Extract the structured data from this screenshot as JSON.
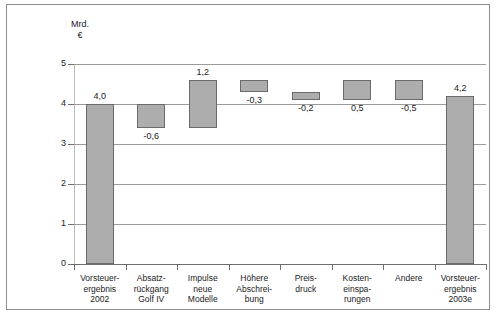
{
  "chart_data": {
    "type": "bar",
    "chart_style": "waterfall",
    "title": "",
    "subtitle": "",
    "unit_caption": "Mrd.\n€",
    "xlabel": "",
    "ylabel": "",
    "ylim": [
      0,
      5
    ],
    "yticks": [
      "0",
      "1",
      "2",
      "3",
      "4",
      "5"
    ],
    "grid": true,
    "legend": "none",
    "categories": [
      "Vorsteuer-\nergebnis\n2002",
      "Absatz-\nrückgang\nGolf IV",
      "Impulse\nneue\nModelle",
      "Höhere\nAbschrei-\nbung",
      "Preis-\ndruck",
      "Kosten-\neinspa-\nrungen",
      "Andere",
      "Vorsteuer-\nergebnis\n2003e"
    ],
    "data_labels": [
      "4,0",
      "-0,6",
      "1,2",
      "-0,3",
      "-0,2",
      "0,5",
      "-0,5",
      "4,2"
    ],
    "values": [
      4.0,
      -0.6,
      1.2,
      -0.3,
      -0.2,
      0.5,
      -0.5,
      4.2
    ],
    "bars": [
      {
        "label": "4,0",
        "value": 4.0,
        "base": 0.0,
        "top": 4.0,
        "kind": "total",
        "label_pos": "above"
      },
      {
        "label": "-0,6",
        "value": -0.6,
        "base": 3.4,
        "top": 4.0,
        "kind": "decrease",
        "label_pos": "below"
      },
      {
        "label": "1,2",
        "value": 1.2,
        "base": 3.4,
        "top": 4.6,
        "kind": "increase",
        "label_pos": "above"
      },
      {
        "label": "-0,3",
        "value": -0.3,
        "base": 4.3,
        "top": 4.6,
        "kind": "decrease",
        "label_pos": "below"
      },
      {
        "label": "-0,2",
        "value": -0.2,
        "base": 4.1,
        "top": 4.3,
        "kind": "decrease",
        "label_pos": "below"
      },
      {
        "label": "0,5",
        "value": 0.5,
        "base": 4.1,
        "top": 4.6,
        "kind": "increase",
        "label_pos": "below"
      },
      {
        "label": "-0,5",
        "value": -0.5,
        "base": 4.1,
        "top": 4.6,
        "kind": "decrease",
        "label_pos": "below"
      },
      {
        "label": "4,2",
        "value": 4.2,
        "base": 0.0,
        "top": 4.2,
        "kind": "total",
        "label_pos": "above"
      }
    ],
    "colors": {
      "bar_fill": "#adadad",
      "bar_border": "#6b6b6b",
      "gridline": "#9a9a9a",
      "axis": "#6e6e6e",
      "frame": "#8d8d8d",
      "text": "#1a1a1a",
      "background": "#ffffff"
    }
  }
}
